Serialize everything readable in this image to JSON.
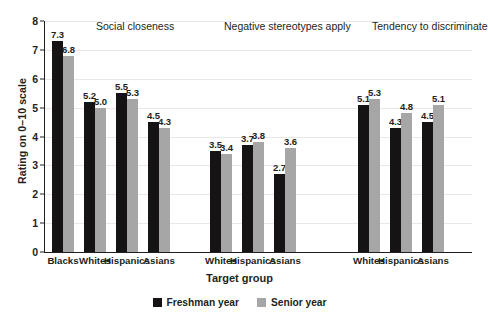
{
  "chart_data": {
    "type": "bar",
    "title": "",
    "xlabel": "Target group",
    "ylabel": "Rating on 0–10 scale",
    "ylim": [
      0,
      8
    ],
    "yticks": [
      0,
      1,
      2,
      3,
      4,
      5,
      6,
      7,
      8
    ],
    "ytick_labels": [
      "0",
      "1",
      "2",
      "3",
      "4",
      "5",
      "6",
      "7",
      "8"
    ],
    "grid": true,
    "legend_position": "bottom-center",
    "series": [
      {
        "name": "Freshman year",
        "color": "#161314"
      },
      {
        "name": "Senior year",
        "color": "#a6a6a6"
      }
    ],
    "panels": [
      {
        "title": "Social closeness",
        "categories": [
          "Blacks",
          "Whites",
          "Hispanics",
          "Asians"
        ],
        "values": {
          "Freshman year": [
            7.3,
            5.2,
            5.5,
            4.5
          ],
          "Senior year": [
            6.8,
            5.0,
            5.3,
            4.3
          ]
        }
      },
      {
        "title": "Negative stereotypes apply",
        "categories": [
          "Whites",
          "Hispanics",
          "Asians"
        ],
        "values": {
          "Freshman year": [
            3.5,
            3.7,
            2.7
          ],
          "Senior year": [
            3.4,
            3.8,
            3.6
          ]
        }
      },
      {
        "title": "Tendency to discriminate",
        "categories": [
          "Whites",
          "Hispanics",
          "Asians"
        ],
        "values": {
          "Freshman year": [
            5.1,
            4.3,
            4.5
          ],
          "Senior year": [
            5.3,
            4.8,
            5.1
          ]
        }
      }
    ]
  },
  "colors": {
    "freshman": "#161314",
    "senior": "#a6a6a6",
    "axis": "#231f20",
    "gridline": "#e9e8e6",
    "background": "#ffffff"
  }
}
